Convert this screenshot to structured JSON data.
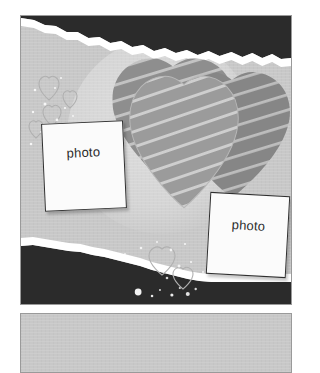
{
  "document": {
    "title": "Scrapbook Page Layout",
    "kind": "photo-album-template"
  },
  "colors": {
    "paper_light": "#c8c8c8",
    "torn_dark": "#2b2b2b",
    "torn_edge_white": "#ffffff",
    "heart_back": "#8e8e8e",
    "heart_right": "#8a8a8a",
    "heart_front": "#9b9b9b",
    "heart_stripe": "#c6c6c6",
    "photo_fill": "#fbfbfb",
    "photo_border": "#2f2f2f",
    "frame_border": "#9a9a9a",
    "text": "#2b2b2b",
    "deco_outline": "#b3b3b3"
  },
  "panels": {
    "main": {
      "name": "main-layout-panel",
      "x": 20,
      "y": 15,
      "width": 272,
      "height": 290
    },
    "secondary": {
      "name": "secondary-layout-panel",
      "x": 20,
      "y": 313,
      "width": 272,
      "height": 60
    }
  },
  "background": {
    "torn_top": {
      "label": "torn-paper-band-top",
      "color": "#2b2b2b",
      "position": "top-right"
    },
    "torn_bottom": {
      "label": "torn-paper-band-bottom",
      "color": "#2b2b2b",
      "position": "bottom-left"
    },
    "halo": {
      "label": "light-halo-circle"
    }
  },
  "hearts": [
    {
      "id": "heart-back-left",
      "label": "striped-heart-back-left",
      "fill": "#8e8e8e",
      "stripe": "#c6c6c6",
      "stripe_angle_deg": -16
    },
    {
      "id": "heart-back-right",
      "label": "striped-heart-back-right",
      "fill": "#8a8a8a",
      "stripe": "#c6c6c6",
      "stripe_angle_deg": -16
    },
    {
      "id": "heart-front-center",
      "label": "striped-heart-front-center",
      "fill": "#9b9b9b",
      "stripe": "#c9c9c9",
      "stripe_angle_deg": -16
    }
  ],
  "photo_slots": [
    {
      "id": "photo-slot-left",
      "label": "photo",
      "rotation_deg": -2.6,
      "x": 22,
      "y": 106,
      "width": 82,
      "height": 88
    },
    {
      "id": "photo-slot-right",
      "label": "photo",
      "rotation_deg": 3.2,
      "x": 187,
      "y": 178,
      "width": 80,
      "height": 82
    }
  ],
  "decorations": {
    "outline_hearts": [
      {
        "id": "deco-heart-1",
        "x": 30,
        "y": 62,
        "size": 16,
        "rotation_deg": -8
      },
      {
        "id": "deco-heart-2",
        "x": 52,
        "y": 76,
        "size": 11,
        "rotation_deg": 12
      },
      {
        "id": "deco-heart-3",
        "x": 34,
        "y": 92,
        "size": 14,
        "rotation_deg": 4
      },
      {
        "id": "deco-heart-4",
        "x": 18,
        "y": 106,
        "size": 12,
        "rotation_deg": -14
      },
      {
        "id": "deco-heart-5",
        "x": 155,
        "y": 242,
        "size": 17,
        "rotation_deg": 6
      },
      {
        "id": "deco-heart-6",
        "x": 176,
        "y": 260,
        "size": 13,
        "rotation_deg": -10
      }
    ],
    "glitter_label": "glitter-speckles"
  }
}
